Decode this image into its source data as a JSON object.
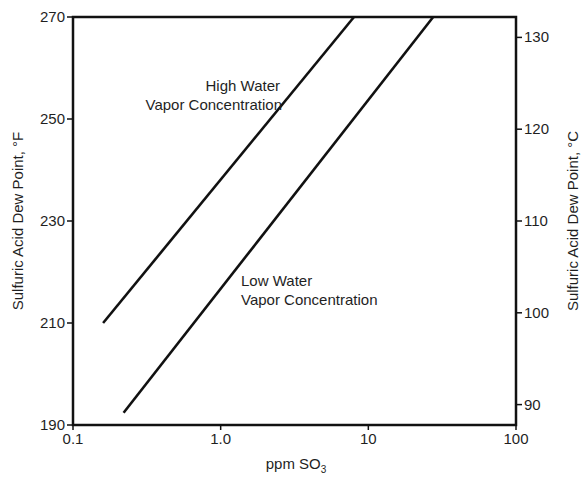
{
  "chart_data": {
    "type": "line",
    "title": "",
    "xlabel": "ppm SO3",
    "xlabel_main": "ppm SO",
    "xlabel_sub": "3",
    "ylabel": "Sulfuric Acid Dew Point, °F",
    "ylabel_right": "Sulfuric Acid Dew Point, °C",
    "xscale": "log",
    "xlim": [
      0.1,
      100
    ],
    "ylim": [
      190,
      270
    ],
    "ylim_right_celsius": [
      87.8,
      132.2
    ],
    "x_ticks": [
      {
        "value": 0.1,
        "label": "0.1"
      },
      {
        "value": 1.0,
        "label": "1.0"
      },
      {
        "value": 10,
        "label": "10"
      },
      {
        "value": 100,
        "label": "100"
      }
    ],
    "y_ticks": [
      {
        "value": 190,
        "label": "190"
      },
      {
        "value": 210,
        "label": "210"
      },
      {
        "value": 230,
        "label": "230"
      },
      {
        "value": 250,
        "label": "250"
      },
      {
        "value": 270,
        "label": "270"
      }
    ],
    "y_ticks_right": [
      {
        "value": 90,
        "label": "90"
      },
      {
        "value": 100,
        "label": "100"
      },
      {
        "value": 110,
        "label": "110"
      },
      {
        "value": 120,
        "label": "120"
      },
      {
        "value": 130,
        "label": "130"
      }
    ],
    "grid": false,
    "legend": null,
    "series": [
      {
        "name": "High Water Vapor Concentration",
        "points": [
          {
            "x": 0.16,
            "y": 210
          },
          {
            "x": 8.0,
            "y": 270
          }
        ]
      },
      {
        "name": "Low Water Vapor Concentration",
        "points": [
          {
            "x": 0.22,
            "y": 192.4
          },
          {
            "x": 27.5,
            "y": 270
          }
        ]
      }
    ],
    "annotations": [
      {
        "lines": [
          "High Water",
          "Vapor Concentration"
        ],
        "align": "right"
      },
      {
        "lines": [
          "Low Water",
          "Vapor Concentration"
        ],
        "align": "left"
      }
    ]
  }
}
